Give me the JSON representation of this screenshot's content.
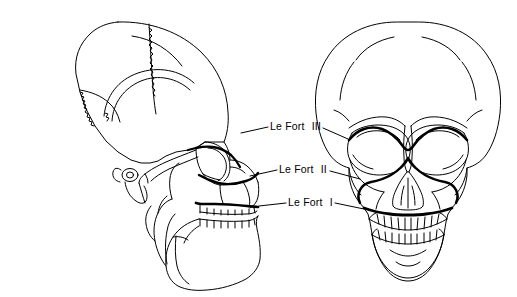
{
  "figure": {
    "views": [
      {
        "name": "lateral-skull-view",
        "description": "Lateral (side) view of human skull"
      },
      {
        "name": "frontal-skull-view",
        "description": "Frontal (anterior) view of human skull"
      }
    ]
  },
  "labels": [
    {
      "id": "le-fort-3",
      "text": "Le Fort",
      "roman": "III"
    },
    {
      "id": "le-fort-2",
      "text": "Le Fort",
      "roman": "II"
    },
    {
      "id": "le-fort-1",
      "text": "Le Fort",
      "roman": "I"
    }
  ],
  "colors": {
    "ink": "#000000",
    "background": "#ffffff",
    "fracture_line": "#000000"
  }
}
